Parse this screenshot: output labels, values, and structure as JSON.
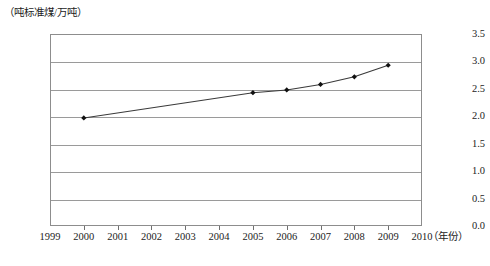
{
  "chart_data": {
    "type": "line",
    "title": "",
    "xlabel": "（年份）",
    "ylabel": "（吨标准煤/万吨）",
    "x": [
      2000,
      2005,
      2006,
      2007,
      2008,
      2009
    ],
    "values": [
      1.97,
      2.43,
      2.48,
      2.58,
      2.72,
      2.93
    ],
    "series": [
      {
        "name": "单位产值能耗",
        "points": [
          {
            "x": 2000,
            "y": 1.97
          },
          {
            "x": 2005,
            "y": 2.43
          },
          {
            "x": 2006,
            "y": 2.48
          },
          {
            "x": 2007,
            "y": 2.58
          },
          {
            "x": 2008,
            "y": 2.72
          },
          {
            "x": 2009,
            "y": 2.93
          }
        ]
      }
    ],
    "xlim": [
      1999,
      2010
    ],
    "ylim": [
      0.0,
      3.5
    ],
    "x_ticks": [
      "1999",
      "2000",
      "2001",
      "2002",
      "2003",
      "2004",
      "2005",
      "2006",
      "2007",
      "2008",
      "2009",
      "2010"
    ],
    "x_tick_values": [
      1999,
      2000,
      2001,
      2002,
      2003,
      2004,
      2005,
      2006,
      2007,
      2008,
      2009,
      2010
    ],
    "y_ticks": [
      "0.0",
      "0.5",
      "1.0",
      "1.5",
      "2.0",
      "2.5",
      "3.0",
      "3.5"
    ],
    "y_tick_values": [
      0.0,
      0.5,
      1.0,
      1.5,
      2.0,
      2.5,
      3.0,
      3.5
    ],
    "grid": "horizontal",
    "legend": null,
    "marker": "diamond",
    "line_color": "#3a3a3a",
    "marker_color": "#111111",
    "grid_color": "#9a9a9a",
    "frame_color": "#8d8d8d"
  },
  "caption": {
    "text": "",
    "visible": false
  }
}
